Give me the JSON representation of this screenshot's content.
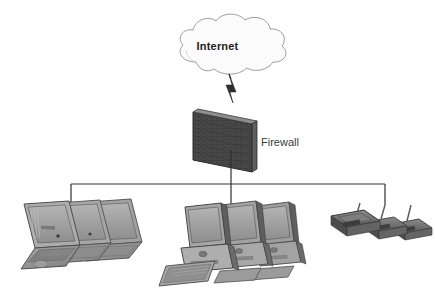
{
  "diagram": {
    "title_text": "Internet",
    "type": "network-topology",
    "background": "#ffffff",
    "width": 435,
    "height": 298,
    "nodes": [
      {
        "id": "internet-cloud",
        "name": "internet-cloud",
        "label": "Internet",
        "shape": "cloud",
        "fill": "#fcfcfc",
        "stroke": "#9a9a9a",
        "center_x": 231,
        "center_y": 48
      },
      {
        "id": "firewall",
        "name": "firewall",
        "label": "Firewall",
        "shape": "brick-wall",
        "fill": "#4a4a4a",
        "stroke": "#2e2e2e",
        "center_x": 222,
        "center_y": 140
      },
      {
        "id": "laptop-group",
        "name": "laptop-group",
        "label": "",
        "shape": "laptop",
        "count": 3,
        "fill": "#9a9a9a",
        "stroke": "#4d4d4d",
        "center_x": 68,
        "center_y": 232
      },
      {
        "id": "desktop-group",
        "name": "desktop-group",
        "label": "",
        "shape": "desktop-computer",
        "count": 3,
        "fill": "#9a9a9a",
        "stroke": "#4d4d4d",
        "center_x": 232,
        "center_y": 240
      },
      {
        "id": "access-point-group",
        "name": "access-point-group",
        "label": "",
        "shape": "wireless-access-point",
        "count": 3,
        "fill": "#6e6e6e",
        "stroke": "#3d3d3d",
        "center_x": 380,
        "center_y": 227
      }
    ],
    "connections": [
      {
        "id": "cloud-to-firewall",
        "name": "lightning-connector",
        "from": "internet-cloud",
        "to": "firewall",
        "style": "lightning-bolt",
        "color": "#2f2f2f"
      },
      {
        "id": "firewall-to-bus",
        "name": "firewall-bus-link",
        "from": "firewall",
        "to": "network-bus",
        "style": "straight-line",
        "color": "#2f2f2f"
      },
      {
        "id": "network-bus",
        "name": "network-bus",
        "from": "x71",
        "to": "x385",
        "style": "horizontal-bus",
        "color": "#2f2f2f",
        "y": 184
      },
      {
        "id": "bus-to-laptops",
        "name": "laptop-drop-link",
        "from": "network-bus",
        "to": "laptop-group",
        "style": "straight-line",
        "color": "#2f2f2f"
      },
      {
        "id": "bus-to-desktops",
        "name": "desktop-drop-link",
        "from": "network-bus",
        "to": "desktop-group",
        "style": "straight-line",
        "color": "#2f2f2f"
      },
      {
        "id": "bus-to-access-points",
        "name": "access-point-drop-link",
        "from": "network-bus",
        "to": "access-point-group",
        "style": "straight-line",
        "color": "#2f2f2f"
      }
    ],
    "labels": {
      "internet": "Internet",
      "firewall": "Firewall"
    }
  }
}
